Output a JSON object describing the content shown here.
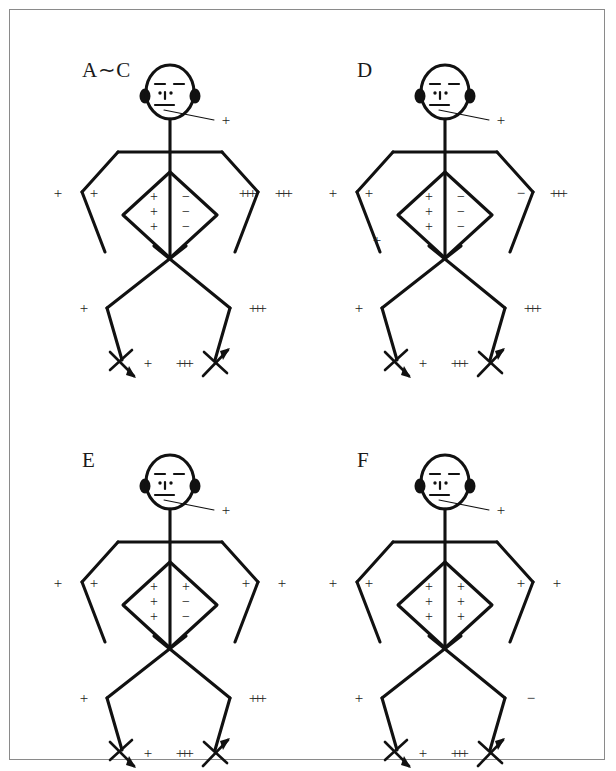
{
  "figure": {
    "background_color": "#ffffff",
    "ink_color": "#111111",
    "border_color": "#8a8a8a"
  },
  "panels": [
    {
      "id": "panel-ac",
      "label": "A∼C",
      "label_x": 52,
      "label_y": 18,
      "face_mark": "+",
      "torso": {
        "left_column": [
          "+",
          "+",
          "+"
        ],
        "right_column": [
          "−",
          "−",
          "−"
        ]
      },
      "left_arm_outer": "+",
      "left_arm_inner": "+",
      "right_arm_inner": "+++",
      "right_arm_outer": "+++",
      "left_arm_lower": "",
      "left_knee": "+",
      "right_knee": "+++",
      "left_foot": "+",
      "right_foot": "+++"
    },
    {
      "id": "panel-d",
      "label": "D",
      "label_x": 52,
      "label_y": 18,
      "face_mark": "+",
      "torso": {
        "left_column": [
          "+",
          "+",
          "+"
        ],
        "right_column": [
          "−",
          "−",
          "−"
        ]
      },
      "left_arm_outer": "+",
      "left_arm_inner": "+",
      "right_arm_inner": "−",
      "right_arm_outer": "+++",
      "left_arm_lower": "+",
      "left_knee": "+",
      "right_knee": "+++",
      "left_foot": "+",
      "right_foot": "+++"
    },
    {
      "id": "panel-e",
      "label": "E",
      "label_x": 52,
      "label_y": 18,
      "face_mark": "+",
      "torso": {
        "left_column": [
          "+",
          "+",
          "+"
        ],
        "right_column": [
          "+",
          "−",
          "−"
        ]
      },
      "left_arm_outer": "+",
      "left_arm_inner": "+",
      "right_arm_inner": "+",
      "right_arm_outer": "+",
      "left_arm_lower": "",
      "left_knee": "+",
      "right_knee": "+++",
      "left_foot": "+",
      "right_foot": "+++"
    },
    {
      "id": "panel-f",
      "label": "F",
      "label_x": 52,
      "label_y": 18,
      "face_mark": "+",
      "torso": {
        "left_column": [
          "+",
          "+",
          "+"
        ],
        "right_column": [
          "+",
          "+",
          "+"
        ]
      },
      "left_arm_outer": "+",
      "left_arm_inner": "+",
      "right_arm_inner": "+",
      "right_arm_outer": "+",
      "left_arm_lower": "",
      "left_knee": "+",
      "right_knee": "−",
      "left_foot": "+",
      "right_foot": "+++"
    }
  ],
  "panel_positions": [
    {
      "id": "panel-ac",
      "left": 20,
      "top": 30
    },
    {
      "id": "panel-d",
      "left": 295,
      "top": 30
    },
    {
      "id": "panel-e",
      "left": 20,
      "top": 420
    },
    {
      "id": "panel-f",
      "left": 295,
      "top": 420
    }
  ]
}
